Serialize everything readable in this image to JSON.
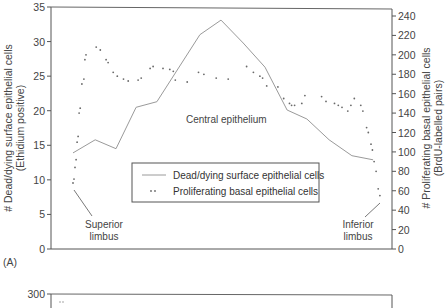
{
  "panel_a": {
    "panel_label": "(A)",
    "left_axis_title_line1": "# Dead/dying surface epithelial cells",
    "left_axis_title_line2": "(Ethidium positive)",
    "right_axis_title_line1": "# Proliferating basal epithelial cells",
    "right_axis_title_line2": "(BrdU-labelled pairs)",
    "annotations": {
      "central": "Central epithelium",
      "superior_line1": "Superior",
      "superior_line2": "limbus",
      "inferior_line1": "Inferior",
      "inferior_line2": "limbus"
    },
    "legend": {
      "line_label": "Dead/dying surface epithelial cells",
      "dots_label": "Proliferating basal epithelial cells"
    }
  },
  "panel_b": {
    "top_tick": "300"
  },
  "colors": {
    "axis": "#555555",
    "line": "#9a9a9a",
    "dots": "#6a6a6a",
    "text": "#444444"
  },
  "chart_data": [
    {
      "type": "line",
      "title": "",
      "panel": "A",
      "xlabel": "",
      "ylabel": "# Dead/dying surface epithelial cells (Ethidium positive)",
      "ylabel_right": "# Proliferating basal epithelial cells (BrdU-labelled pairs)",
      "ylim": [
        0,
        35
      ],
      "ylim_right": [
        0,
        240
      ],
      "yticks": [
        0,
        5,
        10,
        15,
        20,
        25,
        30,
        35
      ],
      "yticks_right": [
        0,
        20,
        40,
        60,
        80,
        100,
        120,
        140,
        160,
        180,
        200,
        220,
        240
      ],
      "grid": false,
      "legend_position": "lower center",
      "x_description": "Position across cornea from superior limbus to inferior limbus",
      "annotations": [
        "Central epithelium",
        "Superior limbus",
        "Inferior limbus"
      ],
      "series": [
        {
          "name": "Dead/dying surface epithelial cells",
          "axis": "left",
          "style": "line",
          "x": [
            0,
            6.5,
            12.6,
            18.5,
            24.6,
            37.2,
            43.4,
            49.9,
            56.3,
            62.8,
            68.6,
            75.1,
            81.8,
            88.0
          ],
          "values": [
            13.9,
            15.8,
            14.5,
            20.5,
            21.3,
            31.0,
            33.1,
            29.8,
            26.3,
            20.1,
            18.8,
            15.8,
            13.5,
            12.9
          ]
        },
        {
          "name": "Proliferating basal epithelial cells",
          "axis": "right",
          "style": "dots",
          "x": [
            0,
            0.3,
            0.6,
            0.9,
            1.2,
            1.5,
            1.8,
            2.1,
            2.6,
            3.2,
            3.5,
            3.8,
            6.8,
            8.0,
            9.7,
            10.3,
            11.8,
            13.0,
            14.8,
            16.2,
            19.1,
            20.0,
            22.6,
            23.5,
            26.4,
            28.4,
            29.4,
            30.0,
            33.5,
            36.8,
            38.4,
            42.0,
            45.5,
            50.9,
            52.9,
            54.8,
            55.6,
            56.8,
            60.1,
            61.8,
            63.5,
            64.1,
            65.0,
            67.1,
            68.0,
            72.9,
            74.2,
            76.7,
            77.8,
            78.9,
            80.6,
            81.5,
            82.5,
            84.4,
            85.0,
            86.1,
            86.6,
            87.4,
            87.8,
            88.3,
            88.9,
            89.5,
            90.0
          ],
          "values": [
            68,
            72,
            84,
            92,
            110,
            116,
            140,
            145,
            170,
            175,
            195,
            200,
            208,
            205,
            195,
            192,
            182,
            178,
            175,
            173,
            174,
            176,
            186,
            188,
            186,
            185,
            183,
            174,
            172,
            182,
            180,
            176,
            175,
            188,
            182,
            178,
            176,
            168,
            167,
            155,
            150,
            148,
            148,
            150,
            158,
            157,
            152,
            150,
            148,
            146,
            142,
            148,
            155,
            148,
            142,
            125,
            120,
            108,
            102,
            90,
            80,
            62,
            55
          ]
        }
      ]
    }
  ]
}
